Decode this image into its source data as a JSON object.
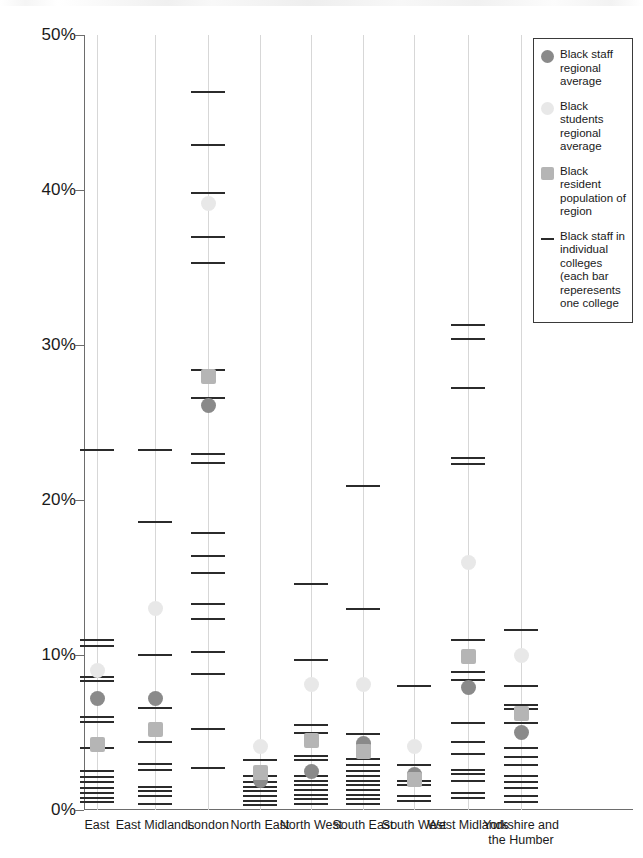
{
  "chart_data": {
    "type": "scatter",
    "title": "",
    "subtitle": "",
    "xlabel": "",
    "ylabel": "",
    "ylim": [
      0,
      50
    ],
    "yticks": [
      0,
      10,
      20,
      30,
      40,
      50
    ],
    "ytick_labels": [
      "0%",
      "10%",
      "20%",
      "30%",
      "40%",
      "50%"
    ],
    "grid": true,
    "grid_axis": "x",
    "legend_position": "top-right",
    "value_unit": "%",
    "categories": [
      "East",
      "East Midlands",
      "London",
      "North East",
      "North West",
      "South East",
      "South West",
      "West Midlands",
      "Yorkshire and the Humber"
    ],
    "series": [
      {
        "name": "Black staff regional average",
        "marker": "circle",
        "color": "#8a8a8a",
        "values": [
          7.2,
          7.2,
          26.1,
          1.9,
          2.5,
          4.3,
          2.3,
          7.9,
          5.0
        ]
      },
      {
        "name": "Black students regional average",
        "marker": "circle",
        "color": "#e8e8e8",
        "values": [
          9.0,
          13.0,
          39.1,
          4.1,
          8.1,
          8.1,
          4.1,
          16.0,
          10.0
        ]
      },
      {
        "name": "Black resident population of region",
        "marker": "square",
        "color": "#b5b5b5",
        "values": [
          4.2,
          5.2,
          28.0,
          2.4,
          4.5,
          3.8,
          2.0,
          9.9,
          6.2
        ]
      }
    ],
    "college_series": {
      "name": "Black staff in individual colleges (each bar reperesents one college",
      "marker": "tick",
      "color": "#2b2b2b",
      "values_by_category": {
        "East": [
          23.2,
          11.0,
          10.6,
          8.6,
          8.3,
          6.0,
          5.7,
          4.0,
          2.5,
          2.1,
          1.8,
          1.4,
          1.1,
          0.8,
          0.5
        ],
        "East Midlands": [
          23.2,
          18.6,
          10.0,
          6.6,
          4.4,
          3.0,
          2.6,
          1.5,
          1.2,
          0.9,
          0.4
        ],
        "London": [
          46.3,
          42.9,
          39.8,
          37.0,
          35.3,
          28.4,
          26.6,
          23.0,
          22.4,
          17.9,
          16.4,
          15.3,
          13.3,
          12.3,
          10.2,
          8.8,
          5.2,
          2.7
        ],
        "North East": [
          3.2,
          2.2,
          1.8,
          1.5,
          1.2,
          0.9,
          0.6,
          0.3
        ],
        "North West": [
          14.6,
          9.7,
          5.5,
          5.0,
          3.5,
          3.2,
          2.2,
          1.9,
          1.6,
          1.3,
          1.0,
          0.7,
          0.4
        ],
        "South East": [
          20.9,
          13.0,
          4.9,
          3.3,
          2.9,
          2.5,
          2.2,
          1.9,
          1.6,
          1.3,
          1.0,
          0.7,
          0.4
        ],
        "South West": [
          8.0,
          2.9,
          1.9,
          1.6,
          0.9,
          0.6
        ],
        "West Midlands": [
          31.3,
          30.4,
          27.2,
          22.7,
          22.3,
          11.0,
          8.9,
          8.4,
          5.6,
          4.4,
          3.6,
          2.6,
          2.3,
          1.9,
          1.1,
          0.8
        ],
        "Yorkshire and the Humber": [
          11.6,
          8.0,
          6.8,
          6.5,
          5.6,
          4.0,
          3.4,
          2.9,
          2.2,
          1.8,
          1.4,
          0.9,
          0.5
        ]
      }
    }
  },
  "legend": {
    "items": [
      {
        "label": "Black staff regional average",
        "marker": "circle",
        "color": "#8a8a8a"
      },
      {
        "label": "Black students regional average",
        "marker": "circle",
        "color": "#e8e8e8"
      },
      {
        "label": "Black resident population of region",
        "marker": "square",
        "color": "#b5b5b5"
      },
      {
        "label": "Black staff in individual colleges (each bar reperesents one college",
        "marker": "line",
        "color": "#2b2b2b"
      }
    ]
  }
}
